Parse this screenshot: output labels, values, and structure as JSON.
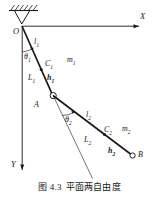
{
  "figure": {
    "caption_number": "图 4.3",
    "caption_title": "平面两自由度",
    "background_color": "#ffffff",
    "line_color": "#1a1a1a"
  },
  "axes": {
    "x_label": "X",
    "y_label": "Y",
    "origin_label": "O"
  },
  "link1": {
    "direction_label": "l<sub>1</sub>",
    "angle_label": "θ<sub>1</sub>",
    "length_label": "L<sub>1</sub>",
    "centroid_label": "C<sub>1</sub>",
    "centroid_distance_label": "h<sub>1</sub>",
    "mass_label": "m<sub>1</sub>",
    "joint_label": "A"
  },
  "link2": {
    "direction_label": "l<sub>2</sub>",
    "angle_label": "θ<sub>2</sub>",
    "length_label": "L<sub>2</sub>",
    "centroid_label": "C<sub>2</sub>",
    "centroid_distance_label": "h<sub>2</sub>",
    "mass_label": "m<sub>2</sub>",
    "end_label": "B"
  },
  "chart_data": {
    "type": "diagram",
    "title": "平面两自由度",
    "nodes": [
      {
        "name": "O",
        "x": 22,
        "y": 26,
        "role": "fixed-pivot"
      },
      {
        "name": "C1",
        "x": 41,
        "y": 63,
        "role": "centroid-link1"
      },
      {
        "name": "A",
        "x": 53,
        "y": 96,
        "role": "revolute-joint"
      },
      {
        "name": "C2",
        "x": 106,
        "y": 135,
        "role": "centroid-link2"
      },
      {
        "name": "B",
        "x": 133,
        "y": 155,
        "role": "free-end"
      }
    ],
    "segments": [
      {
        "from": "O",
        "to": "A",
        "label": "L1",
        "style": "thick"
      },
      {
        "from": "A",
        "to": "B",
        "label": "L2",
        "style": "thick"
      },
      {
        "from": "O",
        "to": "Y",
        "label": "y-axis",
        "style": "thin-arrow"
      },
      {
        "from": "O",
        "to": "X",
        "label": "x-axis",
        "style": "thin-arrow"
      },
      {
        "from": "A",
        "to": "ref",
        "label": "link1-extension",
        "style": "thin"
      }
    ],
    "angles": [
      {
        "name": "θ₁",
        "vertex": "O",
        "between": [
          "y-axis",
          "L1"
        ],
        "value_deg": 18
      },
      {
        "name": "θ₂",
        "vertex": "A",
        "between": [
          "link1-extension",
          "L2"
        ],
        "value_deg": 37
      }
    ]
  }
}
